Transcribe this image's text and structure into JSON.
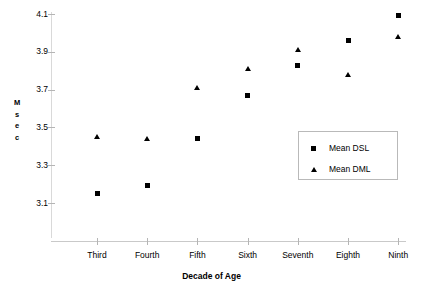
{
  "chart_data": {
    "type": "scatter",
    "title": "",
    "xlabel": "Decade of Age",
    "ylabel": "Msec",
    "categories": [
      "Third",
      "Fourth",
      "Fifth",
      "Sixth",
      "Seventh",
      "Eighth",
      "Ninth"
    ],
    "ylim": [
      3.0,
      4.1
    ],
    "yticks": [
      "4.1",
      "3.9",
      "3.7",
      "3.5",
      "3.3",
      "3.1"
    ],
    "ytick_values": [
      4.1,
      3.9,
      3.7,
      3.5,
      3.3,
      3.1
    ],
    "grid": false,
    "legend_position": "center-right",
    "series": [
      {
        "name": "Mean DSL",
        "marker": "square",
        "color": "#000000",
        "values": [
          3.15,
          3.19,
          3.44,
          3.67,
          3.83,
          3.96,
          4.09
        ]
      },
      {
        "name": "Mean DML",
        "marker": "triangle",
        "color": "#000000",
        "values": [
          3.45,
          3.44,
          3.71,
          3.81,
          3.91,
          3.78,
          3.98
        ]
      }
    ]
  },
  "axis": {
    "y_title_chars": [
      "M",
      "s",
      "e",
      "c"
    ]
  },
  "legend": {
    "entries": [
      {
        "label": "Mean DSL",
        "marker": "square"
      },
      {
        "label": "Mean DML",
        "marker": "triangle"
      }
    ]
  }
}
